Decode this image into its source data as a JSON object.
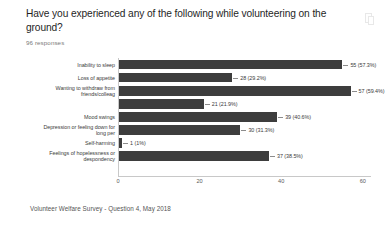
{
  "header": {
    "question": "Have you experienced any of the following while volunteering on the ground?",
    "responses": "96 responses",
    "copy_icon": "copy-icon"
  },
  "caption": "Volunteer Welfare Survey - Question 4, May 2018",
  "chart_data": {
    "type": "bar",
    "orientation": "horizontal",
    "title": "Have you experienced any of the following while volunteering on the ground?",
    "subtitle": "96 responses",
    "xlabel": "",
    "ylabel": "",
    "xlim": [
      0,
      62
    ],
    "xticks": [
      "0",
      "20",
      "40",
      "60"
    ],
    "xtick_values": [
      0,
      20,
      40,
      60
    ],
    "grid": false,
    "legend": false,
    "bar_color": "#3d3d3d",
    "total_responses": 96,
    "categories": [
      "Inability to sleep",
      "Loss of appetite",
      "Wanting to withdraw from\nfriends/colleag",
      "",
      "Mood swings",
      "Depression or feeling down for\nlong per",
      "Self-harming",
      "Feelings of hopelessness or\ndespondency"
    ],
    "values": [
      55,
      28,
      57,
      21,
      39,
      30,
      1,
      37
    ],
    "labels": [
      "55 (57.3%)",
      "28 (29.2%)",
      "57 (59.4%)",
      "21 (21.9%)",
      "39 (40.6%)",
      "30 (31.3%)",
      "1 (1%)",
      "37 (38.5%)"
    ],
    "percents": [
      57.3,
      29.2,
      59.4,
      21.9,
      40.6,
      31.3,
      1.0,
      38.5
    ],
    "bars": [
      {
        "category": "Inability to sleep",
        "value": 55,
        "percent": 57.3,
        "label": "55 (57.3%)"
      },
      {
        "category": "Loss of appetite",
        "value": 28,
        "percent": 29.2,
        "label": "28 (29.2%)"
      },
      {
        "category": "Wanting to withdraw from\nfriends/colleag",
        "value": 57,
        "percent": 59.4,
        "label": "57 (59.4%)"
      },
      {
        "category": "",
        "value": 21,
        "percent": 21.9,
        "label": "21 (21.9%)"
      },
      {
        "category": "Mood swings",
        "value": 39,
        "percent": 40.6,
        "label": "39 (40.6%)"
      },
      {
        "category": "Depression or feeling down for\nlong per",
        "value": 30,
        "percent": 31.3,
        "label": "30 (31.3%)"
      },
      {
        "category": "Self-harming",
        "value": 1,
        "percent": 1.0,
        "label": "1 (1%)"
      },
      {
        "category": "Feelings of hopelessness or\ndespondency",
        "value": 37,
        "percent": 38.5,
        "label": "37 (38.5%)"
      }
    ]
  }
}
